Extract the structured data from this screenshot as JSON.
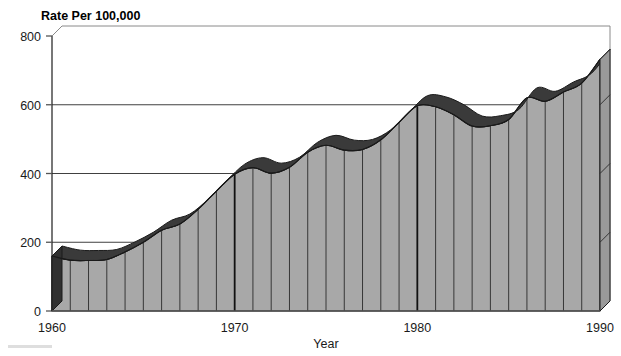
{
  "chart_data": {
    "type": "area",
    "title": "Rate Per 100,000",
    "xlabel": "Year",
    "ylabel": "",
    "ylim": [
      0,
      800
    ],
    "xlim": [
      1960,
      1990
    ],
    "yticks": [
      0,
      200,
      400,
      600,
      800
    ],
    "ytick_labels": [
      "0",
      "200",
      "400",
      "600",
      "800"
    ],
    "xticks": [
      1960,
      1970,
      1980,
      1990
    ],
    "xtick_labels": [
      "1960",
      "1970",
      "1980",
      "1990"
    ],
    "grid": true,
    "grid_lines_y": [
      200,
      400,
      600
    ],
    "legend": null,
    "style": "3d-extruded-area",
    "x": [
      1960,
      1961,
      1962,
      1963,
      1964,
      1965,
      1966,
      1967,
      1968,
      1969,
      1970,
      1971,
      1972,
      1973,
      1974,
      1975,
      1976,
      1977,
      1978,
      1979,
      1980,
      1981,
      1982,
      1983,
      1984,
      1985,
      1986,
      1987,
      1988,
      1989,
      1990
    ],
    "values": [
      160,
      148,
      147,
      150,
      172,
      200,
      235,
      253,
      296,
      349,
      398,
      417,
      401,
      418,
      462,
      482,
      468,
      470,
      498,
      549,
      597,
      594,
      571,
      538,
      539,
      557,
      620,
      610,
      637,
      663,
      732
    ],
    "categories": [
      "1960",
      "1961",
      "1962",
      "1963",
      "1964",
      "1965",
      "1966",
      "1967",
      "1968",
      "1969",
      "1970",
      "1971",
      "1972",
      "1973",
      "1974",
      "1975",
      "1976",
      "1977",
      "1978",
      "1979",
      "1980",
      "1981",
      "1982",
      "1983",
      "1984",
      "1985",
      "1986",
      "1987",
      "1988",
      "1989",
      "1990"
    ],
    "series": [
      {
        "name": "Rate Per 100,000",
        "values": [
          160,
          148,
          147,
          150,
          172,
          200,
          235,
          253,
          296,
          349,
          398,
          417,
          401,
          418,
          462,
          482,
          468,
          470,
          498,
          549,
          597,
          594,
          571,
          538,
          539,
          557,
          620,
          610,
          637,
          663,
          732
        ]
      }
    ],
    "annotations": []
  },
  "colors": {
    "front_face": "#a8a8a8",
    "top_band": "#3a3a3a",
    "side_cap": "#303030",
    "outline": "#1a1a1a",
    "grid": "#2a2a2a",
    "axis": "#555555",
    "background": "#ffffff",
    "text": "#1a1a1a"
  },
  "axis": {
    "title": "Rate Per 100,000",
    "x_label": "Year",
    "y_tick_0": "0",
    "y_tick_1": "200",
    "y_tick_2": "400",
    "y_tick_3": "600",
    "y_tick_4": "800",
    "x_tick_0": "1960",
    "x_tick_1": "1970",
    "x_tick_2": "1980",
    "x_tick_3": "1990"
  }
}
